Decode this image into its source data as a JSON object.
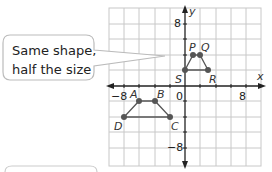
{
  "callout": {
    "line1": "Same shape,",
    "line2": "half the size"
  },
  "axes": {
    "x_label": "x",
    "y_label": "y",
    "origin_label": "0",
    "x_pos_tick": "8",
    "x_neg_tick": "−8",
    "y_pos_tick": "8",
    "y_neg_tick": "−8"
  },
  "shapes": {
    "large": {
      "vertices": [
        {
          "name": "A",
          "x": -6,
          "y": -2
        },
        {
          "name": "B",
          "x": -4,
          "y": -2
        },
        {
          "name": "C",
          "x": -2,
          "y": -4
        },
        {
          "name": "D",
          "x": -8,
          "y": -4
        }
      ]
    },
    "small": {
      "vertices": [
        {
          "name": "P",
          "x": 1,
          "y": 3
        },
        {
          "name": "Q",
          "x": 2,
          "y": 3
        },
        {
          "name": "R",
          "x": 3,
          "y": 2
        },
        {
          "name": "S",
          "x": 0,
          "y": 2
        }
      ]
    }
  },
  "labels": {
    "A": "A",
    "B": "B",
    "C": "C",
    "D": "D",
    "P": "P",
    "Q": "Q",
    "R": "R",
    "S": "S"
  },
  "colors": {
    "grid": "#c8c8c8",
    "axis": "#222222",
    "shape": "#555555",
    "callout_border": "#bbbbbb"
  }
}
